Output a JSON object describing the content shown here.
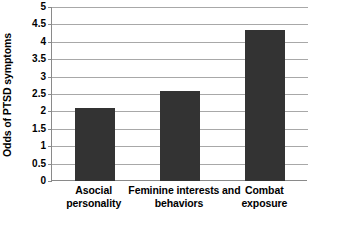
{
  "chart_data": {
    "type": "bar",
    "title": "",
    "xlabel": "",
    "ylabel": "Odds of PTSD symptoms",
    "categories": [
      "Asocial personality",
      "Feminine interests and behaviors",
      "Combat exposure"
    ],
    "category_lines": [
      [
        "Asocial",
        "personality"
      ],
      [
        "Feminine interests and",
        "behaviors"
      ],
      [
        "Combat",
        "exposure"
      ]
    ],
    "values": [
      2.1,
      2.6,
      4.35
    ],
    "ylim": [
      0,
      5
    ],
    "ytick_step": 0.5,
    "yticks": [
      "0",
      "0.5",
      "1",
      "1.5",
      "2",
      "2.5",
      "3",
      "3.5",
      "4",
      "4.5",
      "5"
    ],
    "ytick_values": [
      0,
      0.5,
      1,
      1.5,
      2,
      2.5,
      3,
      3.5,
      4,
      4.5,
      5
    ],
    "grid": true,
    "legend": false,
    "legend_position": "none",
    "bar_color": "#333333",
    "gridline_color": "#a8a8a8",
    "axis_color": "#8a8a8a",
    "background_color": "#ffffff"
  }
}
